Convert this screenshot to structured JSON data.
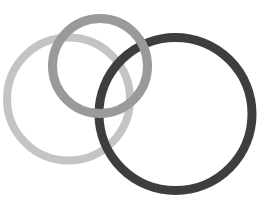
{
  "canvas": {
    "width": 275,
    "height": 216,
    "background": "#ffffff"
  },
  "rings": [
    {
      "name": "light-ring",
      "cx": 68.5,
      "cy": 99,
      "r": 61.5,
      "stroke_width": 8,
      "color": "#c4c4c4",
      "layer": 1
    },
    {
      "name": "dark-ring",
      "cx": 175.5,
      "cy": 114,
      "r": 76.5,
      "stroke_width": 9,
      "color": "#3e3e3e",
      "layer": 2
    },
    {
      "name": "medium-ring",
      "cx": 100,
      "cy": 66,
      "r": 47.5,
      "stroke_width": 9,
      "color": "#9a9a9a",
      "layer": 3
    }
  ]
}
